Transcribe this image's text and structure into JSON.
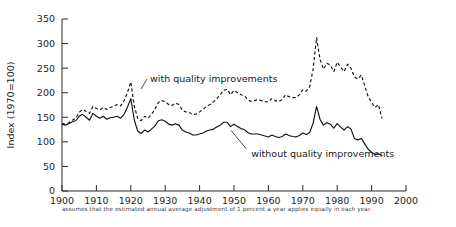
{
  "chart_data": {
    "type": "line",
    "title": "",
    "xlabel": "",
    "ylabel": "Index (1970=100)",
    "xlim": [
      1900,
      2000
    ],
    "ylim": [
      0,
      350
    ],
    "grid": false,
    "legend_position": "inline-annotations",
    "xticks": [
      "1900",
      "1910",
      "1920",
      "1930",
      "1940",
      "1950",
      "1960",
      "1970",
      "1980",
      "1990",
      "2000"
    ],
    "yticks": [
      "0",
      "50",
      "100",
      "150",
      "200",
      "250",
      "300",
      "350"
    ],
    "x": [
      1900,
      1901,
      1902,
      1903,
      1904,
      1905,
      1906,
      1907,
      1908,
      1909,
      1910,
      1911,
      1912,
      1913,
      1914,
      1915,
      1916,
      1917,
      1918,
      1919,
      1920,
      1921,
      1922,
      1923,
      1924,
      1925,
      1926,
      1927,
      1928,
      1929,
      1930,
      1931,
      1932,
      1933,
      1934,
      1935,
      1936,
      1937,
      1938,
      1939,
      1940,
      1941,
      1942,
      1943,
      1944,
      1945,
      1946,
      1947,
      1948,
      1949,
      1950,
      1951,
      1952,
      1953,
      1954,
      1955,
      1956,
      1957,
      1958,
      1959,
      1960,
      1961,
      1962,
      1963,
      1964,
      1965,
      1966,
      1967,
      1968,
      1969,
      1970,
      1971,
      1972,
      1973,
      1974,
      1975,
      1976,
      1977,
      1978,
      1979,
      1980,
      1981,
      1982,
      1983,
      1984,
      1985,
      1986,
      1987,
      1988,
      1989,
      1990,
      1991,
      1992,
      1993
    ],
    "series": [
      {
        "name": "with quality improvements",
        "style": "dashed",
        "values": [
          137,
          136,
          139,
          144,
          148,
          160,
          166,
          162,
          158,
          172,
          168,
          165,
          170,
          166,
          170,
          172,
          176,
          173,
          183,
          200,
          222,
          173,
          148,
          143,
          152,
          148,
          156,
          166,
          180,
          184,
          182,
          176,
          174,
          179,
          176,
          164,
          161,
          160,
          155,
          157,
          161,
          166,
          172,
          176,
          181,
          188,
          196,
          205,
          207,
          196,
          205,
          200,
          196,
          194,
          186,
          182,
          184,
          186,
          184,
          182,
          181,
          188,
          184,
          182,
          186,
          196,
          192,
          190,
          190,
          196,
          206,
          203,
          212,
          248,
          312,
          268,
          248,
          260,
          256,
          243,
          262,
          252,
          243,
          258,
          250,
          232,
          228,
          236,
          214,
          192,
          180,
          170,
          176,
          148
        ]
      },
      {
        "name": "without quality improvements",
        "style": "solid",
        "values": [
          136,
          134,
          137,
          141,
          143,
          152,
          156,
          150,
          144,
          158,
          152,
          148,
          152,
          146,
          149,
          150,
          152,
          148,
          156,
          170,
          188,
          145,
          122,
          117,
          124,
          120,
          126,
          132,
          143,
          145,
          142,
          136,
          134,
          137,
          134,
          124,
          120,
          118,
          114,
          114,
          116,
          118,
          122,
          124,
          126,
          130,
          134,
          140,
          140,
          131,
          136,
          131,
          127,
          125,
          119,
          116,
          116,
          116,
          114,
          112,
          110,
          114,
          111,
          109,
          111,
          116,
          113,
          111,
          110,
          113,
          118,
          115,
          119,
          138,
          172,
          146,
          134,
          139,
          136,
          128,
          137,
          130,
          124,
          131,
          126,
          107,
          104,
          107,
          96,
          85,
          79,
          74,
          76,
          72
        ]
      }
    ],
    "annotations": [
      {
        "text": "with quality improvements",
        "x": 1925,
        "y": 230
      },
      {
        "text": "without quality improvements",
        "x": 1955,
        "y": 78
      }
    ],
    "footnote": "assumes that the estimated annual average adjustment of 1 percent a year applies equally in each year."
  }
}
